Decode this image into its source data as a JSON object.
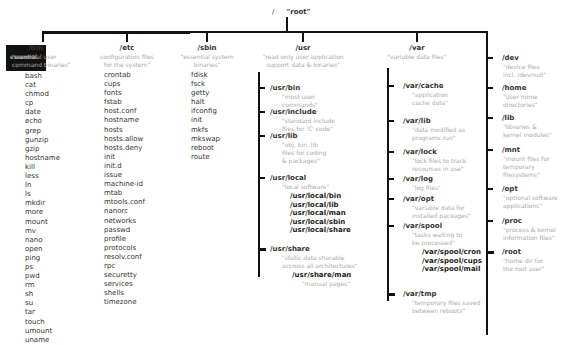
{
  "root": {
    "slash": "/",
    "label": "\"root\""
  },
  "bin": {
    "name": "/bin",
    "desc": "\"essential user\ncommand binaries\"",
    "highlight": "essential",
    "items": [
      "bash",
      "cat",
      "chmod",
      "cp",
      "date",
      "echo",
      "grep",
      "gunzip",
      "gzip",
      "hostname",
      "kill",
      "less",
      "ln",
      "ls",
      "mkdir",
      "more",
      "mount",
      "mv",
      "nano",
      "open",
      "ping",
      "ps",
      "pwd",
      "rm",
      "sh",
      "su",
      "tar",
      "touch",
      "umount",
      "uname"
    ]
  },
  "etc": {
    "name": "/etc",
    "desc": "configuration files\nfor the system\"",
    "items": [
      "crontab",
      "cups",
      "fonts",
      "fstab",
      "host.conf",
      "hostname",
      "hosts",
      "hosts.allow",
      "hosts.deny",
      "init",
      "init.d",
      "issue",
      "machine-id",
      "mtab",
      "mtools.conf",
      "nanorc",
      "networks",
      "passwd",
      "profile",
      "protocols",
      "resolv.conf",
      "rpc",
      "securetty",
      "services",
      "shells",
      "timezone"
    ]
  },
  "sbin": {
    "name": "/sbin",
    "desc": "\"essential system\nbinaries\"",
    "items": [
      "fdisk",
      "fsck",
      "getty",
      "halt",
      "ifconfig",
      "init",
      "mkfs",
      "mkswap",
      "reboot",
      "route"
    ]
  },
  "usr": {
    "name": "/usr",
    "desc": "\"read-only user application\nsupport data & binaries\"",
    "children": [
      {
        "name": "/usr/bin",
        "desc": "\"most user\ncommands\""
      },
      {
        "name": "/usr/include",
        "desc": "\"standard include\nfiles for 'C' code\""
      },
      {
        "name": "/usr/lib",
        "desc": "\"obj, bin, lib\nfiles for coding\n& packages\""
      },
      {
        "name": "/usr/local",
        "desc": "\"local software\"",
        "items": [
          "/usr/local/bin",
          "/usr/local/lib",
          "/usr/local/man",
          "/usr/local/sbin",
          "/usr/local/share"
        ]
      },
      {
        "name": "/usr/share",
        "desc": "\"static data sharable\naccross all architectures\"",
        "items": [
          "/usr/share/man"
        ],
        "item_desc": "\"manual pages\""
      }
    ]
  },
  "var": {
    "name": "/var",
    "desc": "\"variable data files\"",
    "children": [
      {
        "name": "/var/cache",
        "desc": "\"application\ncache data\""
      },
      {
        "name": "/var/lib",
        "desc": "\"data modified as\nprograms run\""
      },
      {
        "name": "/var/lock",
        "desc": "\"lock files to track\nresources in use\""
      },
      {
        "name": "/var/log",
        "desc": "\"log files\""
      },
      {
        "name": "/var/opt",
        "desc": "\"variable data for\ninstalled packages\""
      },
      {
        "name": "/var/spool",
        "desc": "\"tasks waiting to\nbe processed\"",
        "items": [
          "/var/spool/cron",
          "/var/spool/cups",
          "/var/spool/mail"
        ]
      },
      {
        "name": "/var/tmp",
        "desc": "\"temporary files saved\nbetween reboots\""
      }
    ]
  },
  "others": [
    {
      "name": "/dev",
      "desc": "\"device files\nincl. /dev/null\""
    },
    {
      "name": "/home",
      "desc": "\"user home\ndirectories\""
    },
    {
      "name": "/lib",
      "desc": "\"libraries &\nkernel modules\""
    },
    {
      "name": "/mnt",
      "desc": "\"mount files for\ntemporary\nfilesystems\""
    },
    {
      "name": "/opt",
      "desc": "\"optional software\napplications\""
    },
    {
      "name": "/proc",
      "desc": "\"process & kernel\ninformation files\""
    },
    {
      "name": "/root",
      "desc": "\"home dir for\nthe root user\""
    }
  ]
}
